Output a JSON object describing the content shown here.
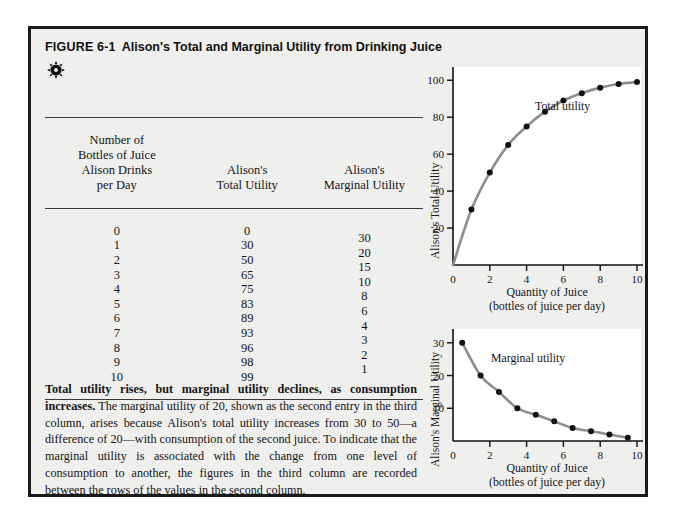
{
  "figure": {
    "number": "FIGURE 6-1",
    "title": "Alison's Total and Marginal Utility from Drinking Juice",
    "icon": "sun-icon",
    "border_color": "#1a1a1a",
    "background_color": "#efefed"
  },
  "table": {
    "headers": {
      "col1": [
        "Number of",
        "Bottles of Juice",
        "Alison Drinks",
        "per Day"
      ],
      "col2": [
        "Alison's",
        "Total Utility"
      ],
      "col3": [
        "Alison's",
        "Marginal Utility"
      ]
    },
    "rows": [
      {
        "quantity": "0",
        "total": "0",
        "marginal": "30"
      },
      {
        "quantity": "1",
        "total": "30",
        "marginal": "20"
      },
      {
        "quantity": "2",
        "total": "50",
        "marginal": "15"
      },
      {
        "quantity": "3",
        "total": "65",
        "marginal": "10"
      },
      {
        "quantity": "4",
        "total": "75",
        "marginal": "8"
      },
      {
        "quantity": "5",
        "total": "83",
        "marginal": "6"
      },
      {
        "quantity": "6",
        "total": "89",
        "marginal": "4"
      },
      {
        "quantity": "7",
        "total": "93",
        "marginal": "3"
      },
      {
        "quantity": "8",
        "total": "96",
        "marginal": "2"
      },
      {
        "quantity": "9",
        "total": "98",
        "marginal": "1"
      },
      {
        "quantity": "10",
        "total": "99",
        "marginal": ""
      }
    ]
  },
  "caption": {
    "lead": "Total utility rises, but marginal utility declines, as consumption increases.",
    "body": " The marginal utility of 20, shown as the second entry in the third column, arises because Alison's total utility increases from 30 to 50—a difference of 20—with consumption of the second juice. To indicate that the marginal utility is associated with the change from one level of consumption to another, the figures in the third column are recorded between the rows of the values in the second column."
  },
  "chart_data": [
    {
      "type": "line",
      "id": "total-utility",
      "title": "",
      "series_label": "Total utility",
      "xlabel": "Quantity of Juice",
      "xlabel_sub": "(bottles of juice per day)",
      "ylabel": "Alison's Total Utility",
      "x": [
        0,
        1,
        2,
        3,
        4,
        5,
        6,
        7,
        8,
        9,
        10
      ],
      "values": [
        0,
        30,
        50,
        65,
        75,
        83,
        89,
        93,
        96,
        98,
        99
      ],
      "marker_x": [
        1,
        2,
        3,
        4,
        5,
        6,
        7,
        8,
        9,
        10
      ],
      "marker_values": [
        30,
        50,
        65,
        75,
        83,
        89,
        93,
        96,
        98,
        99
      ],
      "xlim": [
        0,
        10
      ],
      "ylim": [
        0,
        105
      ],
      "xticks": [
        0,
        2,
        4,
        6,
        8,
        10
      ],
      "xticklabels": [
        "0",
        "2",
        "4",
        "6",
        "8",
        "10"
      ],
      "yticks": [
        20,
        40,
        60,
        80,
        100
      ],
      "yticklabels": [
        "20",
        "40",
        "60",
        "80",
        "100"
      ],
      "grid": false,
      "line_color": "#8d8d8d",
      "marker_color": "#111111",
      "plot_background": "#ffffff"
    },
    {
      "type": "line",
      "id": "marginal-utility",
      "title": "",
      "series_label": "Marginal utility",
      "xlabel": "Quantity of Juice",
      "xlabel_sub": "(bottles of juice per day)",
      "ylabel": "Alison's Marginal Utility",
      "x": [
        0.5,
        1.5,
        2.5,
        3.5,
        4.5,
        5.5,
        6.5,
        7.5,
        8.5,
        9.5
      ],
      "values": [
        30,
        20,
        15,
        10,
        8,
        6,
        4,
        3,
        2,
        1
      ],
      "marker_x": [
        0.5,
        1.5,
        2.5,
        3.5,
        4.5,
        5.5,
        6.5,
        7.5,
        8.5,
        9.5
      ],
      "marker_values": [
        30,
        20,
        15,
        10,
        8,
        6,
        4,
        3,
        2,
        1
      ],
      "xlim": [
        0,
        10
      ],
      "ylim": [
        0,
        33
      ],
      "xticks": [
        0,
        2,
        4,
        6,
        8,
        10
      ],
      "xticklabels": [
        "0",
        "2",
        "4",
        "6",
        "8",
        "10"
      ],
      "yticks": [
        10,
        20,
        30
      ],
      "yticklabels": [
        "10",
        "20",
        "30"
      ],
      "grid": false,
      "line_color": "#8d8d8d",
      "marker_color": "#111111",
      "plot_background": "#ffffff"
    }
  ]
}
